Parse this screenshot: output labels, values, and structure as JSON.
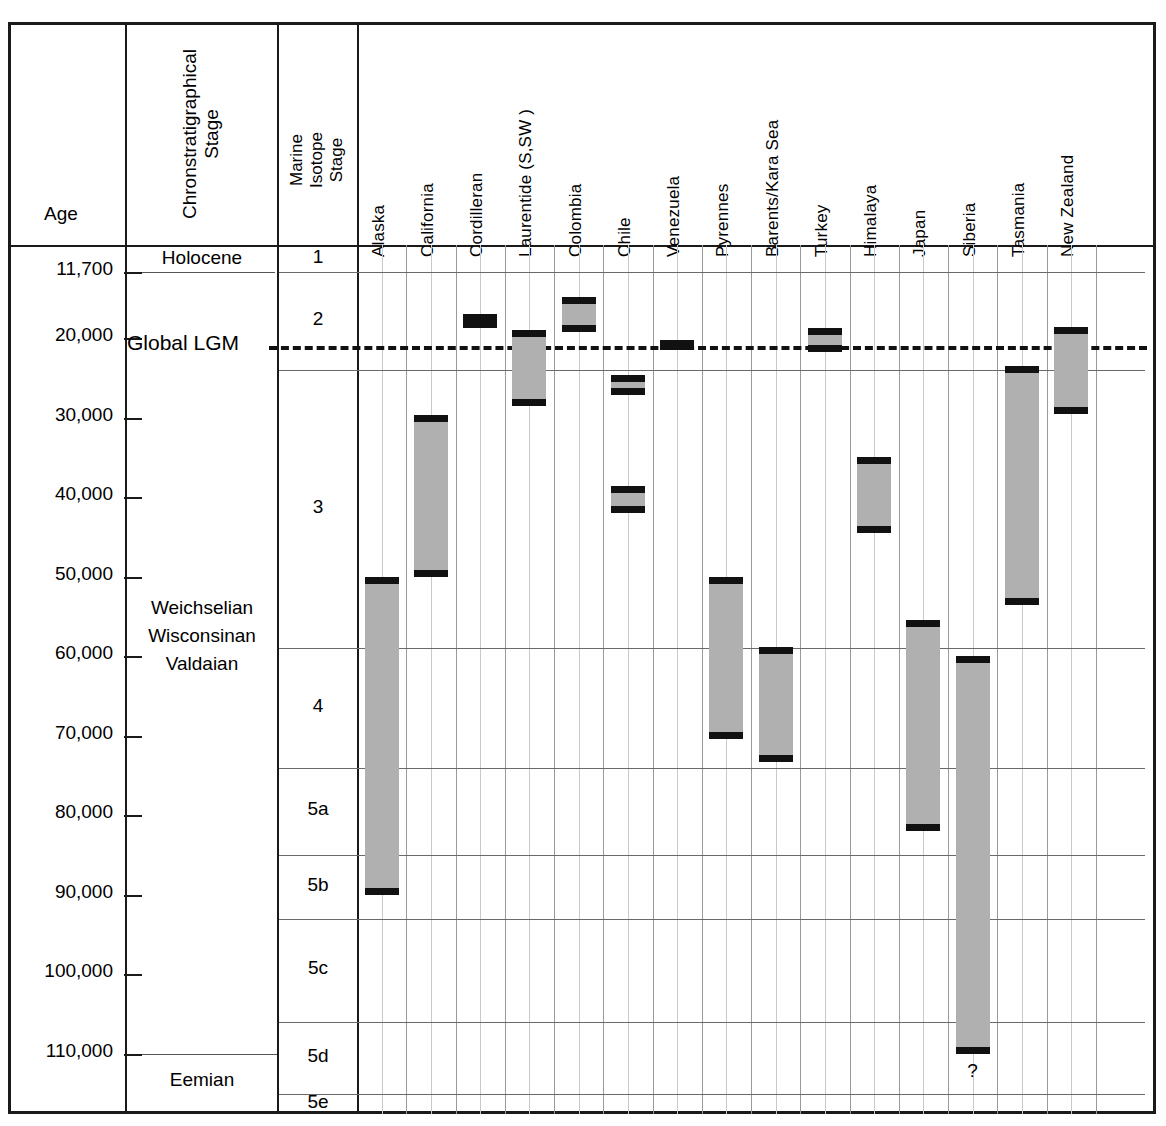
{
  "headers": {
    "age": "Age",
    "chronostratigraphical_stage": [
      "Chronstratigraphical",
      "Stage"
    ],
    "marine_isotope_stage": [
      "Marine",
      "Isotope",
      "Stage"
    ]
  },
  "age_ticks": [
    "11,700",
    "20,000",
    "30,000",
    "40,000",
    "50,000",
    "60,000",
    "70,000",
    "80,000",
    "90,000",
    "100,000",
    "110,000"
  ],
  "chrono_stages": [
    {
      "label": "Holocene"
    },
    {
      "label": "Weichselian"
    },
    {
      "label": "Wisconsinan"
    },
    {
      "label": "Valdaian"
    },
    {
      "label": "Eemian"
    }
  ],
  "lgm_label": "Global LGM",
  "mis_stages": [
    "1",
    "2",
    "3",
    "4",
    "5a",
    "5b",
    "5c",
    "5d",
    "5e"
  ],
  "uncertainty_marker": "?",
  "colors": {
    "bar_fill": "#b0b0b0",
    "bar_cap": "#111111",
    "grid": "#9a9a9a",
    "border": "#1a1a1a"
  },
  "chart_data": {
    "type": "bar",
    "title": "",
    "xlabel": "",
    "ylabel": "Age",
    "ylim": [
      11700,
      118000
    ],
    "y_inverted": true,
    "grid": true,
    "legend": "none",
    "annotations": [
      {
        "text": "Global LGM",
        "y": 21000,
        "style": "dashed-line"
      },
      {
        "text": "?",
        "x": "Siberia",
        "y": 113000
      }
    ],
    "categories": [
      "Alaska",
      "California",
      "Cordilleran",
      "Laurentide (S,SW )",
      "Colombia",
      "Chile",
      "Venezuela",
      "Pyrennes",
      "Barents/Kara Sea",
      "Turkey",
      "Himalaya",
      "Japan",
      "Siberia",
      "Tasmania",
      "New Zealand"
    ],
    "series": [
      {
        "name": "Local glacial maximum age range (years BP)",
        "ranges": [
          {
            "category": "Alaska",
            "from": 50000,
            "to": 90000
          },
          {
            "category": "California",
            "from": 29700,
            "to": 50000
          },
          {
            "category": "Cordilleran",
            "from": 17000,
            "to": 18800
          },
          {
            "category": "Laurentide (S,SW )",
            "from": 19000,
            "to": 28600
          },
          {
            "category": "Colombia",
            "from": 14900,
            "to": 19200
          },
          {
            "category": "Chile",
            "from": 24600,
            "to": 27200
          },
          {
            "category": "Chile",
            "from": 38600,
            "to": 42000
          },
          {
            "category": "Venezuela",
            "from": 20300,
            "to": 21500
          },
          {
            "category": "Pyrennes",
            "from": 50000,
            "to": 70400
          },
          {
            "category": "Barents/Kara Sea",
            "from": 58800,
            "to": 73300
          },
          {
            "category": "Turkey",
            "from": 18700,
            "to": 21800
          },
          {
            "category": "Himalaya",
            "from": 35000,
            "to": 44500
          },
          {
            "category": "Japan",
            "from": 55400,
            "to": 82000
          },
          {
            "category": "Siberia",
            "from": 60000,
            "to": 110000
          },
          {
            "category": "Tasmania",
            "from": 23500,
            "to": 53500
          },
          {
            "category": "New Zealand",
            "from": 18600,
            "to": 29600
          }
        ]
      }
    ],
    "mis_boundaries": [
      {
        "stage": "1",
        "from": 0,
        "to": 11700
      },
      {
        "stage": "2",
        "from": 11700,
        "to": 24000
      },
      {
        "stage": "3",
        "from": 24000,
        "to": 59000
      },
      {
        "stage": "4",
        "from": 59000,
        "to": 74000
      },
      {
        "stage": "5a",
        "from": 74000,
        "to": 85000
      },
      {
        "stage": "5b",
        "from": 85000,
        "to": 93000
      },
      {
        "stage": "5c",
        "from": 93000,
        "to": 106000
      },
      {
        "stage": "5d",
        "from": 106000,
        "to": 115000
      },
      {
        "stage": "5e",
        "from": 115000,
        "to": 128000
      }
    ]
  }
}
